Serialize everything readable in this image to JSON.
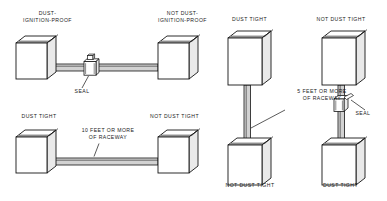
{
  "figure": {
    "type": "technical-diagram",
    "background_color": "#ffffff",
    "line_color": "#141414"
  },
  "panels": [
    {
      "id": "panel-1",
      "orientation": "horizontal",
      "left_box_label": "DUST-\nIGNITION-PROOF",
      "right_box_label": "NOT DUST-\nIGNITION-PROOF",
      "seal_label": "SEAL",
      "has_seal": true,
      "raceway_label": ""
    },
    {
      "id": "panel-2",
      "orientation": "horizontal",
      "left_box_label": "DUST TIGHT",
      "right_box_label": "NOT DUST TIGHT",
      "seal_label": "",
      "has_seal": false,
      "raceway_label": "10 FEET OR MORE\nOF RACEWAY"
    },
    {
      "id": "panel-3",
      "orientation": "vertical",
      "top_box_label": "DUST TIGHT",
      "bottom_box_label": "NOT DUST TIGHT",
      "seal_label": "",
      "has_seal": false,
      "raceway_label": "5 FEET OR MORE\nOF RACEWAY"
    },
    {
      "id": "panel-4",
      "orientation": "vertical",
      "top_box_label": "NOT DUST TIGHT",
      "bottom_box_label": "DUST TIGHT",
      "seal_label": "SEAL",
      "has_seal": true,
      "raceway_label": ""
    }
  ]
}
